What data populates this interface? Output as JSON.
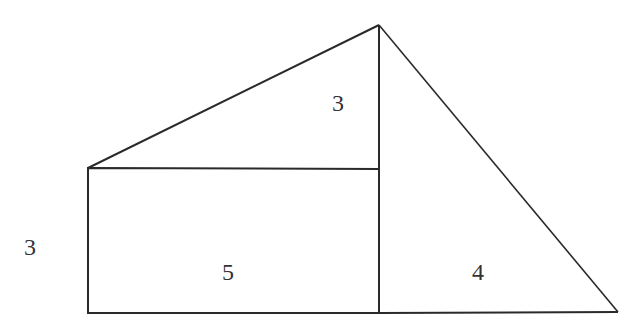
{
  "diagram": {
    "stroke_color": "#2a2a2a",
    "labels": {
      "top_triangle_height": "3",
      "rect_height": "3",
      "rect_width": "5",
      "right_triangle_base": "4"
    }
  }
}
